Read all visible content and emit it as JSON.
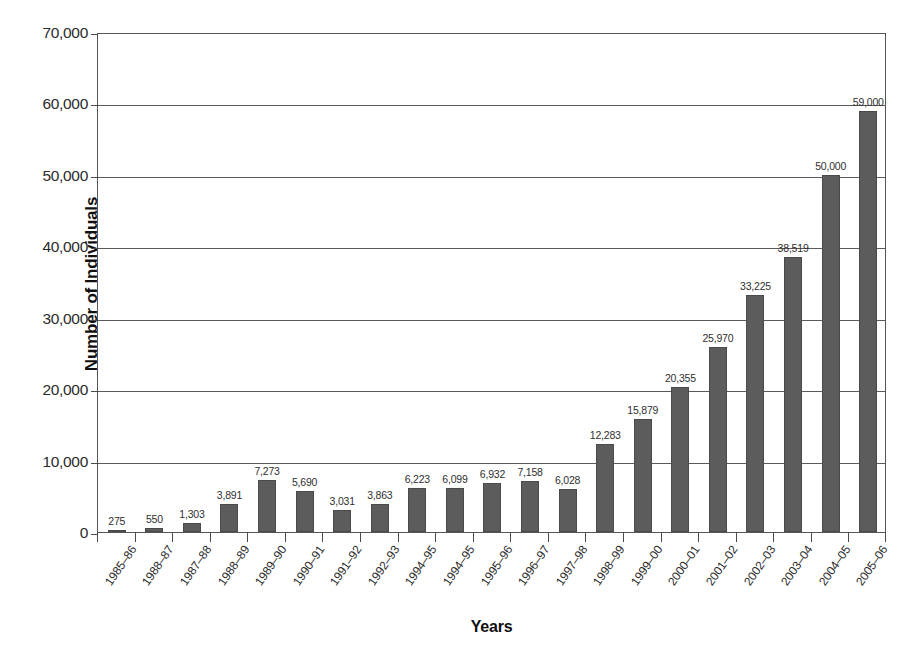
{
  "chart_data": {
    "type": "bar",
    "title": "",
    "xlabel": "Years",
    "ylabel": "Number of Individuals",
    "ylim": [
      0,
      70000
    ],
    "ytick_labels": [
      "0",
      "10,000",
      "20,000",
      "30,000",
      "40,000",
      "50,000",
      "60,000",
      "70,000"
    ],
    "ytick_values": [
      0,
      10000,
      20000,
      30000,
      40000,
      50000,
      60000,
      70000
    ],
    "grid": true,
    "legend": "none",
    "bar_color": "#5c5c5c",
    "categories": [
      "1985–86",
      "1988–87",
      "1987–88",
      "1988–89",
      "1989–90",
      "1990–91",
      "1991–92",
      "1992–93",
      "1994–95",
      "1994–95",
      "1995–96",
      "1996–97",
      "1997–98",
      "1998–99",
      "1999–00",
      "2000–01",
      "2001–02",
      "2002–03",
      "2003–04",
      "2004–05",
      "2005–06"
    ],
    "values": [
      275,
      550,
      1303,
      3891,
      7273,
      5690,
      3031,
      3863,
      6223,
      6099,
      6932,
      7158,
      6028,
      12283,
      15879,
      20355,
      25970,
      33225,
      38519,
      50000,
      59000
    ],
    "value_labels": [
      "275",
      "550",
      "1,303",
      "3,891",
      "7,273",
      "5,690",
      "3,031",
      "3,863",
      "6,223",
      "6,099",
      "6,932",
      "7,158",
      "6,028",
      "12,283",
      "15,879",
      "20,355",
      "25,970",
      "33,225",
      "38,519",
      "50,000",
      "59,000"
    ]
  }
}
